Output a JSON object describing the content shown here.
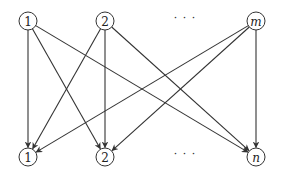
{
  "diagram": {
    "type": "bipartite-directed-graph",
    "top_nodes": [
      {
        "id": "t1",
        "label": "1",
        "x": 28,
        "y": 21,
        "italic": false
      },
      {
        "id": "t2",
        "label": "2",
        "x": 105,
        "y": 21,
        "italic": false
      },
      {
        "id": "tm",
        "label": "m",
        "x": 256,
        "y": 21,
        "italic": true
      }
    ],
    "bottom_nodes": [
      {
        "id": "b1",
        "label": "1",
        "x": 28,
        "y": 157,
        "italic": false
      },
      {
        "id": "b2",
        "label": "2",
        "x": 105,
        "y": 157,
        "italic": false
      },
      {
        "id": "bn",
        "label": "n",
        "x": 256,
        "y": 157,
        "italic": true
      }
    ],
    "ellipsis_top": {
      "label": "· · ·",
      "x": 185,
      "y": 21
    },
    "ellipsis_bottom": {
      "label": "· · ·",
      "x": 185,
      "y": 157
    },
    "node_radius": 9,
    "edges": [
      {
        "from": "t1",
        "to": "b1"
      },
      {
        "from": "t1",
        "to": "b2"
      },
      {
        "from": "t1",
        "to": "bn"
      },
      {
        "from": "t2",
        "to": "b1"
      },
      {
        "from": "t2",
        "to": "b2"
      },
      {
        "from": "t2",
        "to": "bn"
      },
      {
        "from": "tm",
        "to": "b1"
      },
      {
        "from": "tm",
        "to": "b2"
      },
      {
        "from": "tm",
        "to": "bn"
      }
    ],
    "colors": {
      "stroke": "#333333",
      "background": "#ffffff"
    }
  }
}
